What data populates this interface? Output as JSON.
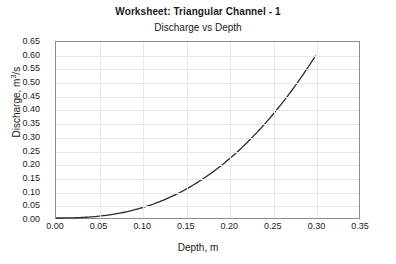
{
  "chart_data": {
    "type": "line",
    "title": "Worksheet: Triangular Channel - 1",
    "subtitle": "Discharge vs Depth",
    "xlabel": "Depth, m",
    "ylabel_prefix": "Discharge, m",
    "ylabel_sup": "3",
    "ylabel_suffix": "/s",
    "xlim": [
      0.0,
      0.35
    ],
    "ylim": [
      0.0,
      0.65
    ],
    "grid": true,
    "legend": "none",
    "line_color": "#2b2b2b",
    "xticks": [
      "0.00",
      "0.05",
      "0.10",
      "0.15",
      "0.20",
      "0.25",
      "0.30",
      "0.35"
    ],
    "yticks": [
      "0.00",
      "0.05",
      "0.10",
      "0.15",
      "0.20",
      "0.25",
      "0.30",
      "0.35",
      "0.40",
      "0.45",
      "0.50",
      "0.55",
      "0.60",
      "0.65"
    ],
    "series": [
      {
        "name": "Discharge vs Depth",
        "x": [
          0.0,
          0.015,
          0.03,
          0.045,
          0.06,
          0.075,
          0.09,
          0.105,
          0.12,
          0.135,
          0.15,
          0.165,
          0.18,
          0.195,
          0.21,
          0.225,
          0.24,
          0.255,
          0.27,
          0.285,
          0.3
        ],
        "y": [
          0.0,
          0.001,
          0.003,
          0.008,
          0.016,
          0.028,
          0.044,
          0.065,
          0.091,
          0.122,
          0.159,
          0.202,
          0.252,
          0.307,
          0.37,
          0.439,
          0.515,
          0.598,
          0.688,
          0.785,
          0.6
        ]
      }
    ]
  }
}
